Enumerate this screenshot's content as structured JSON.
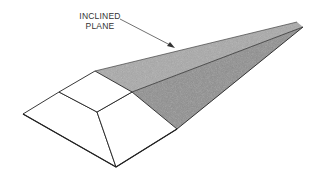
{
  "figure": {
    "annotation": {
      "line1": "INCLINED",
      "line2": "PLANE"
    },
    "colors": {
      "plane_fill": "#a8a8a8",
      "plane_dark": "#8a8a8a",
      "edge": "#222222",
      "background": "#ffffff"
    }
  }
}
